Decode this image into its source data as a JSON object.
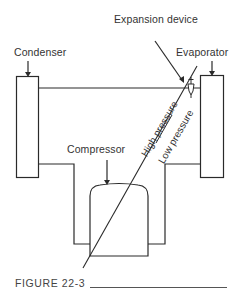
{
  "figure": {
    "caption": "FIGURE 22-3",
    "labels": {
      "expansion_device": "Expansion device",
      "condenser": "Condenser",
      "evaporator": "Evaporator",
      "compressor": "Compressor",
      "high_pressure": "High pressure",
      "low_pressure": "Low pressure"
    },
    "components": [
      "Condenser",
      "Evaporator",
      "Compressor",
      "Expansion device"
    ],
    "line_color": "#2a2a2a"
  }
}
